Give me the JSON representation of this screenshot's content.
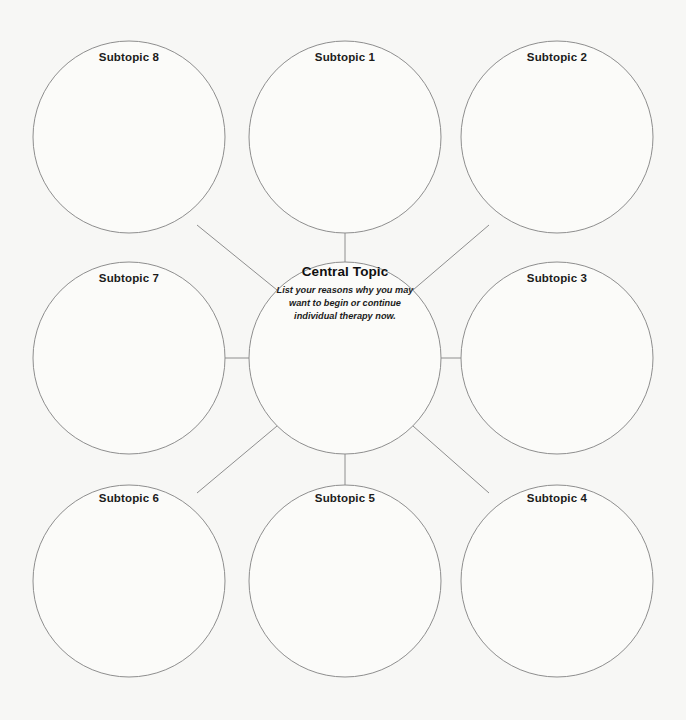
{
  "worksheet": {
    "title": "Mind Map Worksheet",
    "background_color": "#f7f7f5",
    "stroke_color": "#8e8e8e",
    "text_color": "#1b1b1b"
  },
  "central": {
    "title": "Central Topic",
    "description_line_1": "List your reasons why you may",
    "description_line_2": "want to begin or continue",
    "description_line_3": "individual therapy now."
  },
  "subtopics": [
    {
      "id": "subtopic-8",
      "label": "Subtopic 8",
      "cx": 129,
      "cy": 137,
      "r": 96,
      "label_x": 129,
      "label_y": 57
    },
    {
      "id": "subtopic-1",
      "label": "Subtopic 1",
      "cx": 345,
      "cy": 137,
      "r": 96,
      "label_x": 345,
      "label_y": 57
    },
    {
      "id": "subtopic-2",
      "label": "Subtopic 2",
      "cx": 557,
      "cy": 137,
      "r": 96,
      "label_x": 557,
      "label_y": 57
    },
    {
      "id": "subtopic-7",
      "label": "Subtopic 7",
      "cx": 129,
      "cy": 358,
      "r": 96,
      "label_x": 129,
      "label_y": 278
    },
    {
      "id": "subtopic-3",
      "label": "Subtopic 3",
      "cx": 557,
      "cy": 358,
      "r": 96,
      "label_x": 557,
      "label_y": 278
    },
    {
      "id": "subtopic-6",
      "label": "Subtopic 6",
      "cx": 129,
      "cy": 581,
      "r": 96,
      "label_x": 129,
      "label_y": 498
    },
    {
      "id": "subtopic-5",
      "label": "Subtopic 5",
      "cx": 345,
      "cy": 581,
      "r": 96,
      "label_x": 345,
      "label_y": 498
    },
    {
      "id": "subtopic-4",
      "label": "Subtopic 4",
      "cx": 557,
      "cy": 581,
      "r": 96,
      "label_x": 557,
      "label_y": 498
    }
  ],
  "central_node": {
    "cx": 345,
    "cy": 358,
    "r": 96,
    "text_x": 345,
    "text_y": 265
  },
  "connectors": [
    {
      "id": "connector-center-to-subtopic-1",
      "from": "central",
      "to": "subtopic-1",
      "x1": 345,
      "y1": 262,
      "x2": 345,
      "y2": 233
    },
    {
      "id": "connector-center-to-subtopic-5",
      "from": "central",
      "to": "subtopic-5",
      "x1": 345,
      "y1": 454,
      "x2": 345,
      "y2": 485
    },
    {
      "id": "connector-center-to-subtopic-7",
      "from": "central",
      "to": "subtopic-7",
      "x1": 249,
      "y1": 358,
      "x2": 225,
      "y2": 358
    },
    {
      "id": "connector-center-to-subtopic-3",
      "from": "central",
      "to": "subtopic-3",
      "x1": 441,
      "y1": 358,
      "x2": 461,
      "y2": 358
    },
    {
      "id": "connector-center-to-subtopic-8",
      "from": "central",
      "to": "subtopic-8",
      "x1": 277,
      "y1": 290,
      "x2": 197,
      "y2": 225
    },
    {
      "id": "connector-center-to-subtopic-2",
      "from": "central",
      "to": "subtopic-2",
      "x1": 413,
      "y1": 290,
      "x2": 489,
      "y2": 225
    },
    {
      "id": "connector-center-to-subtopic-6",
      "from": "central",
      "to": "subtopic-6",
      "x1": 277,
      "y1": 426,
      "x2": 197,
      "y2": 493
    },
    {
      "id": "connector-center-to-subtopic-4",
      "from": "central",
      "to": "subtopic-4",
      "x1": 413,
      "y1": 426,
      "x2": 489,
      "y2": 493
    }
  ]
}
